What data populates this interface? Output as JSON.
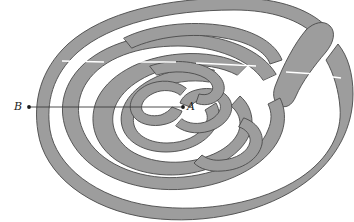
{
  "figure": {
    "kind": "labyrinth-diagram",
    "title": "",
    "caption": "",
    "width": 354,
    "height": 222,
    "background_color": "#ffffff"
  },
  "colors": {
    "wall_fill": "#9d9d9d",
    "wall_stroke": "#4a4a4a",
    "path_fill": "#ffffff",
    "connector_stroke": "#3a3a3a",
    "dot_fill": "#1a1a1a",
    "gap_mark": "#ffffff"
  },
  "labels": {
    "inner_point": "A",
    "outer_point": "B"
  },
  "points": {
    "A": {
      "x": 183,
      "y": 107,
      "label": "A",
      "label_x": 187,
      "label_y": 101,
      "description": "center of labyrinth"
    },
    "B": {
      "x": 29,
      "y": 107,
      "label": "B",
      "label_x": 14,
      "label_y": 101,
      "description": "outside the labyrinth"
    }
  },
  "connector": {
    "from": "B",
    "to": "A",
    "x1": 29,
    "y1": 107,
    "x2": 183,
    "y2": 107,
    "stroke_width": 0.9
  },
  "geometry": {
    "bounds": {
      "left": 48,
      "top": 10,
      "right": 341,
      "bottom": 207
    },
    "band_width": 12,
    "ring_count": 7,
    "gap_marks": [
      {
        "x1": 62,
        "y1": 61,
        "x2": 104,
        "y2": 62
      },
      {
        "x1": 126,
        "y1": 62,
        "x2": 176,
        "y2": 62
      },
      {
        "x1": 196,
        "y1": 63,
        "x2": 256,
        "y2": 66
      },
      {
        "x1": 286,
        "y1": 72,
        "x2": 316,
        "y2": 74
      },
      {
        "x1": 318,
        "y1": 75,
        "x2": 341,
        "y2": 78
      }
    ]
  }
}
